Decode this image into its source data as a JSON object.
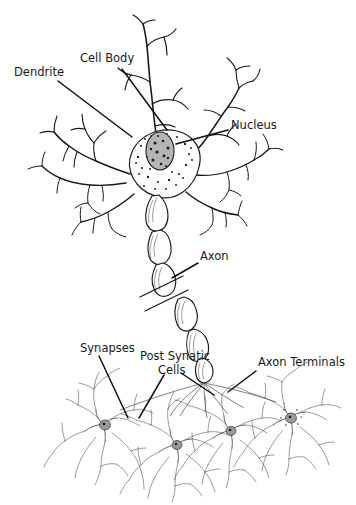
{
  "figure": {
    "background_color": "#ffffff",
    "ink_color": "#1a1a1a",
    "label_color": "#1a1a1a",
    "nucleus_fill": "#b5b5b5"
  },
  "labels": {
    "dendrite": "Dendrite",
    "cell_body": "Cell Body",
    "nucleus": "Nucleus",
    "axon": "Axon",
    "synapses": "Synapses",
    "post_synaptic_cells_line1": "Post Synatic",
    "post_synaptic_cells_line2": "Cells",
    "axon_terminals": "Axon Terminals"
  },
  "parts": [
    {
      "name": "dendrite",
      "label": "Dendrite",
      "label_x": 14,
      "label_y": 76
    },
    {
      "name": "cell-body",
      "label": "Cell Body",
      "label_x": 80,
      "label_y": 62
    },
    {
      "name": "nucleus",
      "label": "Nucleus",
      "label_x": 230,
      "label_y": 128
    },
    {
      "name": "axon",
      "label": "Axon",
      "label_x": 200,
      "label_y": 259
    },
    {
      "name": "synapses",
      "label": "Synapses",
      "label_x": 82,
      "label_y": 352
    },
    {
      "name": "post-synaptic-cells",
      "label": "Post Synatic Cells",
      "label_x": 141,
      "label_y": 361
    },
    {
      "name": "axon-terminals",
      "label": "Axon Terminals",
      "label_x": 259,
      "label_y": 365
    }
  ],
  "postsynaptic_neuron_count": 4
}
